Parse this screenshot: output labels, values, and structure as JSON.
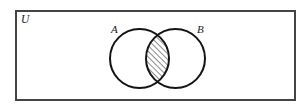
{
  "figure": {
    "type": "venn-diagram",
    "width": 307,
    "height": 111,
    "background_color": "#ffffff",
    "ink_color": "#1a1a1a"
  },
  "universe": {
    "label": "U",
    "border_color": "#444444",
    "border_width": 2,
    "rect": {
      "x": 16,
      "y": 11,
      "width": 279,
      "height": 89
    }
  },
  "sets": [
    {
      "id": "A",
      "label": "A",
      "stroke_color": "#141414",
      "stroke_width": 2,
      "fill": "none",
      "circle": {
        "cx": 139.5,
        "cy": 58.5,
        "r": 29.5
      }
    },
    {
      "id": "B",
      "label": "B",
      "stroke_color": "#141414",
      "stroke_width": 2,
      "fill": "none",
      "circle": {
        "cx": 175.5,
        "cy": 58.5,
        "r": 29.5
      }
    }
  ],
  "shaded_region": {
    "name": "A-intersect-B",
    "notation": "A ∩ B",
    "fill_style": "diagonal-hatch",
    "hatch_angle_degrees": 45,
    "hatch_spacing": 4,
    "hatch_stroke_width": 1,
    "hatch_color": "#1a1a1a",
    "bounds": {
      "x": 146,
      "y": 34,
      "width": 24,
      "height": 50
    }
  },
  "chart_data": {
    "type": "diagram",
    "title": "",
    "regions": [
      {
        "name": "U",
        "shaded": false
      },
      {
        "name": "A only",
        "shaded": false
      },
      {
        "name": "B only",
        "shaded": false
      },
      {
        "name": "A ∩ B",
        "shaded": true
      }
    ],
    "labels": [
      "U",
      "A",
      "B"
    ]
  }
}
